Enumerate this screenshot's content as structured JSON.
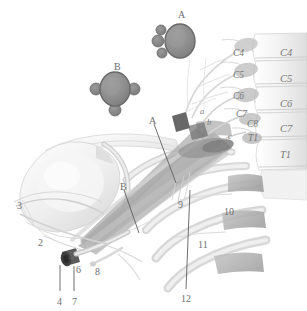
{
  "figure": {
    "background_color": "#ffffff",
    "width": 307,
    "height": 311,
    "line_color": "#5f5f5f",
    "inset_fill": "#8d8d8d",
    "inset_stroke": "#6a6a6a",
    "bone_light": "#f2f2f2",
    "bone_mid": "#e2e2e2",
    "bone_shadow": "#c9c9c9",
    "trunk_gray": "#b9b9b9",
    "trunk_dark": "#8f8f8f"
  },
  "insets": [
    {
      "id": "A",
      "label": "A",
      "label_x": 178,
      "label_y": 10,
      "cx": 180,
      "cy": 41,
      "rx": 15,
      "ry": 17,
      "satellites": [
        {
          "cx": 161,
          "cy": 30,
          "r": 5
        },
        {
          "cx": 158,
          "cy": 41,
          "r": 6
        },
        {
          "cx": 162,
          "cy": 53,
          "r": 5
        }
      ]
    },
    {
      "id": "B",
      "label": "B",
      "label_x": 114,
      "label_y": 62,
      "cx": 115,
      "cy": 89,
      "rx": 15,
      "ry": 17,
      "satellites": [
        {
          "cx": 96,
          "cy": 89,
          "r": 6
        },
        {
          "cx": 134,
          "cy": 89,
          "r": 6
        },
        {
          "cx": 115,
          "cy": 110,
          "r": 6
        }
      ]
    }
  ],
  "vertebral_body_labels": [
    {
      "text": "C4",
      "x": 280,
      "y": 48
    },
    {
      "text": "C5",
      "x": 280,
      "y": 74
    },
    {
      "text": "C6",
      "x": 280,
      "y": 99
    },
    {
      "text": "C7",
      "x": 280,
      "y": 124
    },
    {
      "text": "T1",
      "x": 280,
      "y": 150
    }
  ],
  "nerve_root_labels": [
    {
      "text": "C4",
      "x": 233,
      "y": 48
    },
    {
      "text": "C5",
      "x": 233,
      "y": 70
    },
    {
      "text": "C6",
      "x": 233,
      "y": 91
    },
    {
      "text": "C7",
      "x": 236,
      "y": 109
    },
    {
      "text": "C8",
      "x": 247,
      "y": 119
    },
    {
      "text": "T1",
      "x": 248,
      "y": 133
    }
  ],
  "letter_labels": [
    {
      "text": "a",
      "x": 200,
      "y": 106
    },
    {
      "text": "b",
      "x": 207,
      "y": 117
    },
    {
      "text": "c",
      "x": 228,
      "y": 131
    }
  ],
  "callout_labels": [
    {
      "text": "A",
      "x": 149,
      "y": 116,
      "leader": {
        "x1": 154,
        "y1": 124,
        "x2": 176,
        "y2": 183
      }
    },
    {
      "text": "B",
      "x": 120,
      "y": 182,
      "leader": {
        "x1": 124,
        "y1": 190,
        "x2": 139,
        "y2": 233
      }
    },
    {
      "text": "1",
      "x": 176,
      "y": 120,
      "leader": null
    },
    {
      "text": "2",
      "x": 38,
      "y": 238,
      "leader": null
    },
    {
      "text": "3",
      "x": 17,
      "y": 201,
      "leader": null
    },
    {
      "text": "4",
      "x": 57,
      "y": 297,
      "leader": {
        "x1": 60,
        "y1": 291,
        "x2": 60,
        "y2": 265
      }
    },
    {
      "text": "5",
      "x": 69,
      "y": 251,
      "leader": null
    },
    {
      "text": "6",
      "x": 76,
      "y": 265,
      "leader": null
    },
    {
      "text": "7",
      "x": 72,
      "y": 297,
      "leader": {
        "x1": 74,
        "y1": 291,
        "x2": 74,
        "y2": 266
      }
    },
    {
      "text": "8",
      "x": 95,
      "y": 267,
      "leader": null
    },
    {
      "text": "9",
      "x": 178,
      "y": 200,
      "leader": null
    },
    {
      "text": "10",
      "x": 224,
      "y": 207,
      "leader": null
    },
    {
      "text": "11",
      "x": 198,
      "y": 240,
      "leader": null
    },
    {
      "text": "12",
      "x": 181,
      "y": 294,
      "leader": {
        "x1": 186,
        "y1": 289,
        "x2": 190,
        "y2": 190
      }
    }
  ]
}
